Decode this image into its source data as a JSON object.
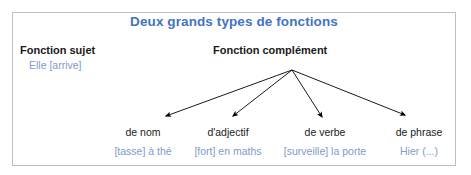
{
  "title": "Deux grands types de fonctions",
  "colors": {
    "title": "#4472c4",
    "example_text": "#7f9bc9",
    "label_text": "#1a1a1a",
    "frame_border": "#bfbfbf",
    "arrow": "#000000",
    "background": "#ffffff"
  },
  "subject": {
    "label": "Fonction sujet",
    "example": "Elle [arrive]"
  },
  "complement": {
    "label": "Fonction complément",
    "branches": [
      {
        "label": "de nom",
        "example": "[tasse] à thé"
      },
      {
        "label": "d'adjectif",
        "example": "[fort] en maths"
      },
      {
        "label": "de verbe",
        "example": "[surveille] la porte"
      },
      {
        "label": "de phrase",
        "example": "Hier (...)"
      }
    ]
  },
  "diagram": {
    "type": "tree",
    "apex": {
      "x": 292,
      "y": 70
    },
    "arrow_tips": [
      {
        "x": 161,
        "y": 118
      },
      {
        "x": 229,
        "y": 118
      },
      {
        "x": 324,
        "y": 120
      },
      {
        "x": 410,
        "y": 117
      }
    ]
  }
}
